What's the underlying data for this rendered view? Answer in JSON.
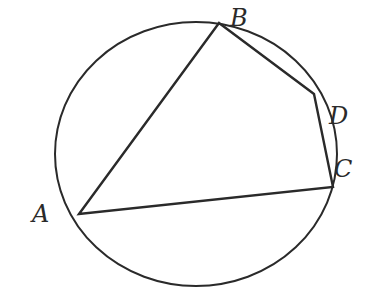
{
  "diagram": {
    "stroke_color": "#2a2a2a",
    "background": "#ffffff",
    "circle": {
      "cx": 196,
      "cy": 154,
      "rx": 141,
      "ry": 132
    },
    "points": {
      "A": {
        "x": 79,
        "y": 214
      },
      "B": {
        "x": 219,
        "y": 23
      },
      "D": {
        "x": 314,
        "y": 94
      },
      "C": {
        "x": 333,
        "y": 187
      }
    },
    "segments": [
      [
        "A",
        "B"
      ],
      [
        "B",
        "D"
      ],
      [
        "D",
        "C"
      ],
      [
        "C",
        "A"
      ]
    ],
    "labels": {
      "A": {
        "text": "A",
        "x": 32,
        "y": 222
      },
      "B": {
        "text": "B",
        "x": 230,
        "y": 26
      },
      "D": {
        "text": "D",
        "x": 329,
        "y": 124
      },
      "C": {
        "text": "C",
        "x": 334,
        "y": 177
      }
    }
  }
}
